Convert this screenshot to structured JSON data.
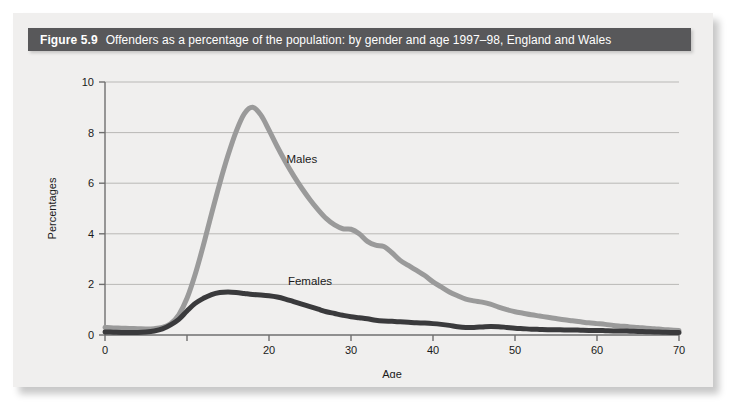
{
  "figure": {
    "number_label": "Figure 5.9",
    "caption": "Offenders as a percentage of the population: by gender and age 1997–98, England and Wales",
    "title_bar_color": "#58585a",
    "panel_color": "#f0efee"
  },
  "chart_data": {
    "type": "line",
    "title": "Offenders as a percentage of the population: by gender and age 1997–98, England and Wales",
    "xlabel": "Age",
    "ylabel": "Percentages",
    "xlim": [
      0,
      70
    ],
    "ylim": [
      0,
      10
    ],
    "xticks": [
      0,
      10,
      20,
      30,
      40,
      50,
      60,
      70
    ],
    "xtick_labels": [
      "0",
      "",
      "20",
      "30",
      "40",
      "50",
      "60",
      "70"
    ],
    "yticks": [
      0,
      2,
      4,
      6,
      8,
      10
    ],
    "ytick_labels": [
      "0",
      "2",
      "4",
      "6",
      "8",
      "10"
    ],
    "grid": "horizontal",
    "legend": "inline-annotations",
    "series": [
      {
        "name": "Males",
        "color": "#9a9a9a",
        "label_x": 24,
        "label_y": 6.95,
        "x": [
          0,
          1,
          2,
          3,
          4,
          5,
          6,
          7,
          8,
          9,
          10,
          11,
          12,
          13,
          14,
          15,
          16,
          17,
          18,
          19,
          20,
          21,
          22,
          23,
          24,
          25,
          26,
          27,
          28,
          29,
          30,
          31,
          32,
          33,
          34,
          35,
          36,
          37,
          38,
          39,
          40,
          41,
          42,
          43,
          44,
          45,
          46,
          47,
          48,
          49,
          50,
          51,
          52,
          53,
          54,
          55,
          56,
          57,
          58,
          59,
          60,
          61,
          62,
          63,
          64,
          65,
          66,
          67,
          68,
          69,
          70
        ],
        "values": [
          0.3,
          0.28,
          0.27,
          0.26,
          0.25,
          0.24,
          0.25,
          0.3,
          0.45,
          0.8,
          1.45,
          2.4,
          3.55,
          4.8,
          6.0,
          7.1,
          8.05,
          8.75,
          9.0,
          8.7,
          8.1,
          7.45,
          6.85,
          6.3,
          5.8,
          5.35,
          4.95,
          4.6,
          4.35,
          4.2,
          4.18,
          4.0,
          3.7,
          3.55,
          3.5,
          3.25,
          2.95,
          2.75,
          2.55,
          2.35,
          2.1,
          1.9,
          1.7,
          1.55,
          1.42,
          1.35,
          1.3,
          1.22,
          1.1,
          1.0,
          0.92,
          0.86,
          0.8,
          0.75,
          0.7,
          0.65,
          0.6,
          0.56,
          0.52,
          0.48,
          0.45,
          0.42,
          0.38,
          0.35,
          0.32,
          0.3,
          0.27,
          0.25,
          0.22,
          0.2,
          0.18
        ]
      },
      {
        "name": "Females",
        "color": "#3a3a3c",
        "label_x": 25,
        "label_y": 2.15,
        "x": [
          0,
          1,
          2,
          3,
          4,
          5,
          6,
          7,
          8,
          9,
          10,
          11,
          12,
          13,
          14,
          15,
          16,
          17,
          18,
          19,
          20,
          21,
          22,
          23,
          24,
          25,
          26,
          27,
          28,
          29,
          30,
          31,
          32,
          33,
          34,
          35,
          36,
          37,
          38,
          39,
          40,
          41,
          42,
          43,
          44,
          45,
          46,
          47,
          48,
          49,
          50,
          51,
          52,
          53,
          54,
          55,
          56,
          57,
          58,
          59,
          60,
          61,
          62,
          63,
          64,
          65,
          66,
          67,
          68,
          69,
          70
        ],
        "values": [
          0.12,
          0.11,
          0.1,
          0.1,
          0.1,
          0.12,
          0.16,
          0.24,
          0.4,
          0.62,
          0.95,
          1.25,
          1.45,
          1.6,
          1.68,
          1.7,
          1.68,
          1.64,
          1.6,
          1.58,
          1.55,
          1.5,
          1.42,
          1.32,
          1.22,
          1.12,
          1.02,
          0.92,
          0.85,
          0.78,
          0.72,
          0.68,
          0.64,
          0.58,
          0.55,
          0.54,
          0.52,
          0.5,
          0.48,
          0.47,
          0.45,
          0.42,
          0.38,
          0.33,
          0.3,
          0.3,
          0.32,
          0.34,
          0.33,
          0.3,
          0.27,
          0.25,
          0.23,
          0.22,
          0.21,
          0.21,
          0.2,
          0.2,
          0.19,
          0.18,
          0.18,
          0.17,
          0.16,
          0.16,
          0.15,
          0.14,
          0.13,
          0.12,
          0.11,
          0.1,
          0.1
        ]
      }
    ]
  }
}
